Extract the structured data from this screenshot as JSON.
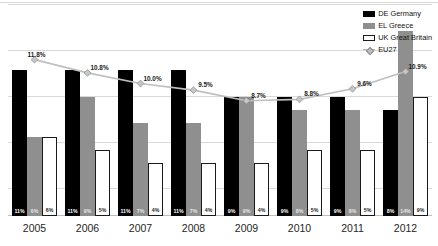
{
  "chart_data": {
    "type": "bar",
    "title": "",
    "xlabel": "",
    "ylabel": "",
    "ylim": [
      0,
      16
    ],
    "grid": true,
    "legend_position": "top-right",
    "categories": [
      "2005",
      "2006",
      "2007",
      "2008",
      "2009",
      "2010",
      "2011",
      "2012"
    ],
    "series": [
      {
        "name": "DE Germany",
        "key": "de",
        "color": "#000000",
        "type": "bar",
        "values": [
          11,
          11,
          11,
          11,
          9,
          9,
          9,
          8
        ],
        "labels": [
          "11%",
          "11%",
          "11%",
          "11%",
          "9%",
          "9%",
          "9%",
          "8%"
        ]
      },
      {
        "name": "EL Greece",
        "key": "el",
        "color": "#8f8f8f",
        "type": "bar",
        "values": [
          6,
          9,
          7,
          7,
          9,
          8,
          8,
          14
        ],
        "labels": [
          "6%",
          "9%",
          "7%",
          "7%",
          "9%",
          "8%",
          "8%",
          "14%"
        ]
      },
      {
        "name": "UK Great Britain",
        "key": "uk",
        "color": "#ffffff",
        "type": "bar",
        "values": [
          6,
          5,
          4,
          4,
          4,
          5,
          5,
          9
        ],
        "labels": [
          "6%",
          "5%",
          "4%",
          "4%",
          "4%",
          "5%",
          "5%",
          "9%"
        ]
      },
      {
        "name": "EU27",
        "key": "eu27",
        "color": "#bfbfbf",
        "type": "line",
        "values": [
          11.8,
          10.8,
          10.0,
          9.5,
          8.7,
          8.8,
          9.6,
          10.9
        ],
        "labels": [
          "11.8%",
          "10.8%",
          "10.0%",
          "9.5%",
          "8.7%",
          "8.8%",
          "9.6%",
          "10.9%"
        ]
      }
    ]
  },
  "legend": {
    "items": [
      {
        "label": "DE Germany",
        "swatch": "de"
      },
      {
        "label": "EL Greece",
        "swatch": "el"
      },
      {
        "label": "UK Great Britain",
        "swatch": "uk"
      },
      {
        "label": "EU27",
        "swatch": "eu"
      }
    ]
  },
  "colors": {
    "de": "#000000",
    "el": "#8f8f8f",
    "uk": "#ffffff",
    "eu27": "#bfbfbf",
    "grid": "#d9d9d9",
    "background": "#ffffff"
  }
}
